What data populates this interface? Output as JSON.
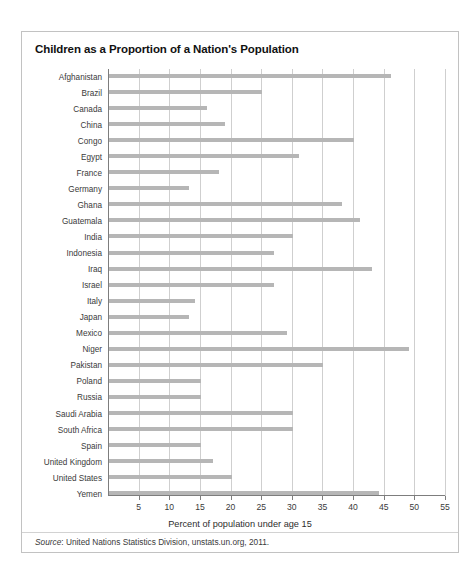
{
  "page": {
    "top_sliver_text": "     "
  },
  "figure": {
    "title": "Children as a Proportion of a Nation's Population",
    "source_prefix": "Source",
    "source_text": ": United Nations Statistics Division, unstats.un.org, 2011."
  },
  "chart_data": {
    "type": "bar",
    "orientation": "horizontal",
    "title": "Children as a Proportion of a Nation's Population",
    "xlabel": "Percent of population under age 15",
    "ylabel": "",
    "xlim": [
      0,
      55
    ],
    "xticks": [
      5,
      10,
      15,
      20,
      25,
      30,
      35,
      40,
      45,
      50,
      55
    ],
    "grid": true,
    "grid_axis": "x",
    "legend": false,
    "bar_color": "#b6b6b6",
    "categories": [
      "Afghanistan",
      "Brazil",
      "Canada",
      "China",
      "Congo",
      "Egypt",
      "France",
      "Germany",
      "Ghana",
      "Guatemala",
      "India",
      "Indonesia",
      "Iraq",
      "Israel",
      "Italy",
      "Japan",
      "Mexico",
      "Niger",
      "Pakistan",
      "Poland",
      "Russia",
      "Saudi Arabia",
      "South Africa",
      "Spain",
      "United Kingdom",
      "United States",
      "Yemen"
    ],
    "values": [
      46,
      25,
      16,
      19,
      40,
      31,
      18,
      13,
      38,
      41,
      30,
      27,
      43,
      27,
      14,
      13,
      29,
      49,
      35,
      15,
      15,
      30,
      30,
      15,
      17,
      20,
      44
    ]
  }
}
